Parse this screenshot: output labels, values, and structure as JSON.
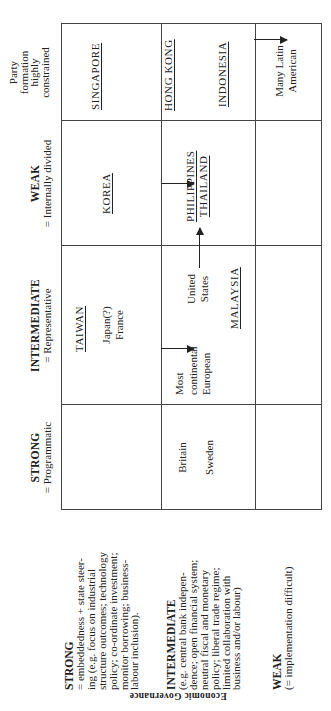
{
  "axis_label": "Economic Governance",
  "column_headers": [
    {
      "title": "STRONG",
      "subtitle": "= Programmatic"
    },
    {
      "title": "INTERMEDIATE",
      "subtitle": "= Representative"
    },
    {
      "title": "WEAK",
      "subtitle": "= Internally divided"
    },
    {
      "lines": [
        "Party",
        "formation",
        "highly",
        "constrained"
      ]
    }
  ],
  "row_labels": [
    {
      "title": "STRONG",
      "lines": [
        "= embeddedness + state steer-",
        "ing (e.g. focus on industrial",
        "structure outcomes; technology",
        "policy; co-ordinate investment;",
        "monitor borrowing; business-",
        "labour inclusion)."
      ]
    },
    {
      "title": "INTERMEDIATE",
      "lines": [
        "(e.g. central bank indepen-",
        "dence; open financial system;",
        "neutral fiscal and monetary",
        "policy; liberal trade regime;",
        "limited collaboration with",
        "business and/or labour)"
      ]
    },
    {
      "title": "WEAK",
      "lines": [
        "(= implementation difficult)"
      ]
    }
  ],
  "cells": {
    "strong_gov": {
      "strong_party": "",
      "intermediate_party": {
        "country": "TAIWAN",
        "others": [
          "Japan(?)",
          "France"
        ]
      },
      "weak_party": "KOREA",
      "constrained_party": "SINGAPORE"
    },
    "intermediate_gov": {
      "strong_party": [
        "Britain",
        "Sweden"
      ],
      "intermediate_party": {
        "group1": [
          "Most",
          "continental",
          "European"
        ],
        "group2": [
          "United",
          "States"
        ],
        "country": "MALAYSIA"
      },
      "weak_party": [
        "PHILIPPINES",
        "THAILAND"
      ],
      "constrained_party": [
        "HONG KONG",
        "INDONESIA"
      ]
    },
    "weak_gov": {
      "strong_party": "",
      "intermediate_party": "",
      "weak_party": "",
      "constrained_party": [
        "Many Latin",
        "American"
      ]
    }
  },
  "arrows": [
    {
      "from": "TAIWAN / Japan / France",
      "to": "Most continental European",
      "direction": "strong→intermediate governance"
    },
    {
      "from": "KOREA",
      "to": "PHILIPPINES / THAILAND",
      "direction": "strong→intermediate governance"
    },
    {
      "from": "United States",
      "to": "PHILIPPINES / THAILAND",
      "direction": "intermediate→weak party"
    },
    {
      "from": "INDONESIA",
      "to": "Many Latin American",
      "direction": "intermediate→weak governance"
    }
  ]
}
